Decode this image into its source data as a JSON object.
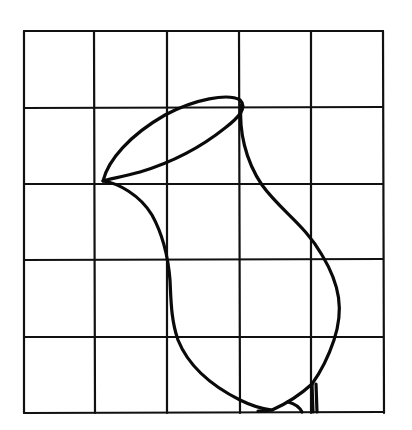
{
  "diagram": {
    "grid": {
      "columns": 5,
      "rows": 5
    },
    "figure": {
      "subject": "vase outline",
      "parts": [
        "rim-ellipse",
        "body-outline",
        "base-foot"
      ]
    },
    "colors": {
      "background": "#ffffff",
      "ink": "#0a0a0a"
    }
  }
}
